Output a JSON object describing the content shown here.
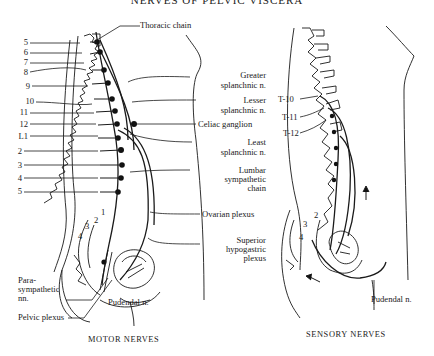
{
  "header": {
    "title": "NERVES OF PELVIC VISCERA"
  },
  "motor": {
    "caption": "MOTOR NERVES",
    "vertebra_labels": [
      "5",
      "6",
      "7",
      "8",
      "9",
      "10",
      "11",
      "12",
      "L1",
      "2",
      "3",
      "4",
      "5"
    ],
    "sacral_labels": [
      "1",
      "2",
      "3",
      "4"
    ],
    "labels": {
      "thoracic_chain": "Thoracic chain",
      "greater_1": "Greater",
      "greater_2": "splanchnic n.",
      "lesser_1": "Lesser",
      "lesser_2": "splanchnic n.",
      "celiac": "Celiac ganglion",
      "least_1": "Least",
      "least_2": "splanchnic n.",
      "lumbar_1": "Lumbar",
      "lumbar_2": "sympathetic",
      "lumbar_3": "chain",
      "ovarian": "Ovarian plexus",
      "superior_1": "Superior",
      "superior_2": "hypogastric",
      "superior_3": "plexus",
      "para_1": "Para-",
      "para_2": "sympathetic",
      "para_3": "nn.",
      "pelvic": "Pelvic plexus",
      "pudendal": "Pudendal n."
    }
  },
  "sensory": {
    "caption": "SENSORY NERVES",
    "vertebra_labels": [
      "T-10",
      "T-11",
      "T-12"
    ],
    "sacral_labels": [
      "2",
      "3",
      "4"
    ],
    "labels": {
      "pudendal": "Pudendal n."
    }
  }
}
